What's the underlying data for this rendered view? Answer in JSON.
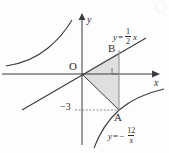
{
  "figure": {
    "type": "math-graph",
    "background_color": "#fdfdfd",
    "stroke_color": "#3a3a40",
    "shade_color": "#d9d9d9",
    "axes": {
      "x_label": "x",
      "y_label": "y",
      "origin_label": "O",
      "origin_px": {
        "x": 82,
        "y": 74
      },
      "x_axis_y_px": 74,
      "y_axis_x_px": 82
    },
    "ticks": [
      {
        "axis": "y",
        "label": "−3",
        "value": -3,
        "px": {
          "x": 60,
          "y": 102
        }
      }
    ],
    "points": [
      {
        "name": "A",
        "label": "A",
        "px": {
          "x": 119,
          "y": 110
        },
        "label_px": {
          "x": 114,
          "y": 112
        }
      },
      {
        "name": "B",
        "label": "B",
        "px": {
          "x": 119,
          "y": 52
        },
        "label_px": {
          "x": 108,
          "y": 43
        }
      }
    ],
    "curves": [
      {
        "name": "line",
        "equation_text": "y = 1/2 x",
        "equation_parts": {
          "lhs": "y",
          "eq": "=",
          "num": "1",
          "den": "2",
          "var": "x",
          "sign": ""
        },
        "label_px": {
          "x": 113,
          "y": 28
        }
      },
      {
        "name": "hyperbola",
        "equation_text": "y = -12/x",
        "equation_parts": {
          "lhs": "y",
          "eq": "=",
          "sign": "−",
          "num": "12",
          "den": "x",
          "var": ""
        },
        "label_px": {
          "x": 108,
          "y": 127
        }
      }
    ],
    "annotations": [
      {
        "name": "right-angle-mark",
        "px": {
          "x": 119,
          "y": 74
        }
      },
      {
        "name": "dashed-guide",
        "from_px": {
          "x": 75,
          "y": 110
        },
        "to_px": {
          "x": 119,
          "y": 110
        }
      },
      {
        "name": "shaded-triangle",
        "vertices_px": [
          [
            82,
            74
          ],
          [
            119,
            52
          ],
          [
            119,
            110
          ]
        ]
      }
    ]
  }
}
